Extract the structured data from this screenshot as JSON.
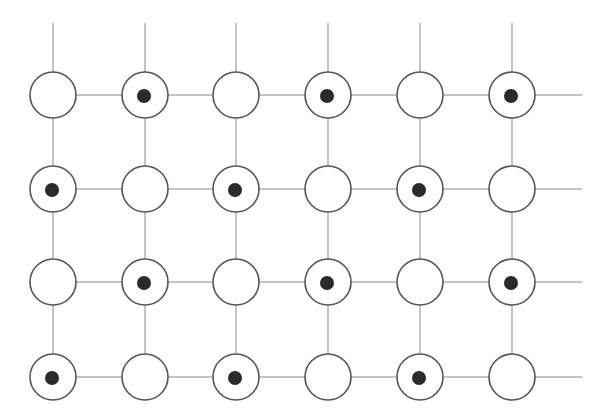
{
  "diagram": {
    "type": "lattice-grid",
    "rows": 4,
    "cols": 6,
    "col_x": [
      53,
      145,
      236,
      328,
      420,
      512
    ],
    "row_y": [
      95,
      189,
      282,
      377
    ],
    "node_radius": 23,
    "dot_radius": 7,
    "line_top_y": 23,
    "line_right_x": 582,
    "colors": {
      "line": "#8a8a8a",
      "circle_stroke": "#555555",
      "circle_fill": "#ffffff",
      "dot": "#2a2a2a"
    },
    "occupancy": [
      [
        0,
        1,
        0,
        1,
        0,
        1
      ],
      [
        1,
        0,
        1,
        0,
        1,
        0
      ],
      [
        0,
        1,
        0,
        1,
        0,
        1
      ],
      [
        1,
        0,
        1,
        0,
        1,
        0
      ]
    ]
  }
}
